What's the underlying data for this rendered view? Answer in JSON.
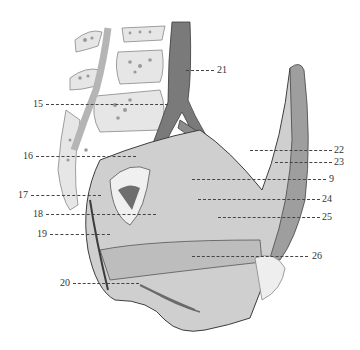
{
  "figure": {
    "type": "anatomical-illustration",
    "colors": {
      "background": "#ffffff",
      "tissue_light": "#d9d9d9",
      "tissue_mid": "#a8a8a8",
      "tissue_dark": "#4a4a4a",
      "label_text": "#333333"
    }
  },
  "labels": {
    "left": [
      {
        "id": "15",
        "text": "15"
      },
      {
        "id": "16",
        "text": "16"
      },
      {
        "id": "17",
        "text": "17"
      },
      {
        "id": "18",
        "text": "18"
      },
      {
        "id": "19",
        "text": "19"
      },
      {
        "id": "20",
        "text": "20"
      }
    ],
    "right": [
      {
        "id": "21",
        "text": "21"
      },
      {
        "id": "22",
        "text": "22"
      },
      {
        "id": "23",
        "text": "23"
      },
      {
        "id": "9",
        "text": "9"
      },
      {
        "id": "24",
        "text": "24"
      },
      {
        "id": "25",
        "text": "25"
      },
      {
        "id": "26",
        "text": "26"
      }
    ]
  }
}
